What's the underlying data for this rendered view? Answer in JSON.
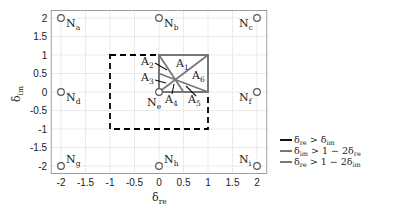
{
  "chart_data": {
    "type": "diagram",
    "xlabel": "δ_re",
    "ylabel": "δ_im",
    "xlim": [
      -2.2,
      2.2
    ],
    "ylim": [
      -2.2,
      2.2
    ],
    "x_ticks": [
      "-2",
      "-1.5",
      "-1",
      "-0.5",
      "0",
      "0.5",
      "1",
      "1.5",
      "2"
    ],
    "y_ticks": [
      "2",
      "1.5",
      "1",
      "0.5",
      "0",
      "-0.5",
      "-1",
      "-1.5",
      "-2"
    ],
    "grid": true,
    "nodes": [
      {
        "name": "N",
        "sub": "a",
        "x": -2,
        "y": 2
      },
      {
        "name": "N",
        "sub": "b",
        "x": 0,
        "y": 2
      },
      {
        "name": "N",
        "sub": "c",
        "x": 2,
        "y": 2
      },
      {
        "name": "N",
        "sub": "d",
        "x": -2,
        "y": 0
      },
      {
        "name": "N",
        "sub": "e",
        "x": 0,
        "y": 0
      },
      {
        "name": "N",
        "sub": "f",
        "x": 2,
        "y": 0
      },
      {
        "name": "N",
        "sub": "g",
        "x": -2,
        "y": -2
      },
      {
        "name": "N",
        "sub": "h",
        "x": 0,
        "y": -2
      },
      {
        "name": "N",
        "sub": "i",
        "x": 2,
        "y": -2
      }
    ],
    "regions": [
      {
        "name": "A",
        "sub": "1"
      },
      {
        "name": "A",
        "sub": "2"
      },
      {
        "name": "A",
        "sub": "3"
      },
      {
        "name": "A",
        "sub": "4"
      },
      {
        "name": "A",
        "sub": "5"
      },
      {
        "name": "A",
        "sub": "6"
      }
    ],
    "dashed_square": {
      "x": [
        -1,
        1
      ],
      "y": [
        -1,
        1
      ],
      "color": "#000000"
    },
    "inner_square": {
      "x": [
        0,
        1
      ],
      "y": [
        0,
        1
      ],
      "color": "#777777"
    },
    "lines": [
      {
        "label": "δ_re > δ_im",
        "from": [
          0,
          0
        ],
        "to": [
          1,
          1
        ]
      },
      {
        "label": "δ_im > 1 − 2δ_re",
        "from": [
          0,
          1
        ],
        "to": [
          0.5,
          0
        ]
      },
      {
        "label": "δ_re > 1 − 2δ_im",
        "from": [
          0,
          0.5
        ],
        "to": [
          1,
          0
        ]
      }
    ],
    "legend": [
      {
        "main": "δ",
        "sub": "re",
        "rel": " > δ",
        "sub2": "im",
        "tail": "",
        "color": "#111111"
      },
      {
        "main": "δ",
        "sub": "im",
        "rel": " > 1 − 2δ",
        "sub2": "re",
        "tail": "",
        "color": "#777777"
      },
      {
        "main": "δ",
        "sub": "re",
        "rel": " > 1 − 2δ",
        "sub2": "im",
        "tail": "",
        "color": "#777777"
      }
    ],
    "legend_position": "right"
  }
}
